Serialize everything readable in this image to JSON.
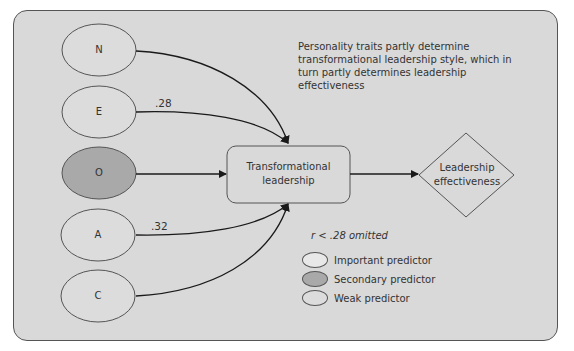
{
  "diagram": {
    "title_caption": "Personality traits partly determine transformational leadership style, which in turn partly determines leadership effectiveness",
    "caption_lines": [
      "Personality traits partly determine",
      "transformational leadership style, which in",
      "turn partly determines leadership",
      "effectiveness"
    ],
    "predictors": [
      {
        "label": "N",
        "type": "weak",
        "coefficient": ""
      },
      {
        "label": "E",
        "type": "weak",
        "coefficient": ".28"
      },
      {
        "label": "O",
        "type": "secondary",
        "coefficient": ""
      },
      {
        "label": "A",
        "type": "weak",
        "coefficient": ".32"
      },
      {
        "label": "C",
        "type": "weak",
        "coefficient": ""
      }
    ],
    "mediator": {
      "line1": "Transformational",
      "line2": "leadership"
    },
    "outcome": {
      "line1": "Leadership",
      "line2": "effectiveness"
    },
    "note": "r < .28 omitted",
    "legend": [
      {
        "label": "Important predictor",
        "fill": "#e8e8e8"
      },
      {
        "label": "Secondary predictor",
        "fill": "#a9a9a9"
      },
      {
        "label": "Weak predictor",
        "fill": "#dcdcdc"
      }
    ],
    "colors": {
      "background": "#d9d9d9",
      "weak_fill": "#dcdcdc",
      "secondary_fill": "#a9a9a9",
      "stroke": "#555555",
      "arrow": "#1a1a1a"
    }
  }
}
